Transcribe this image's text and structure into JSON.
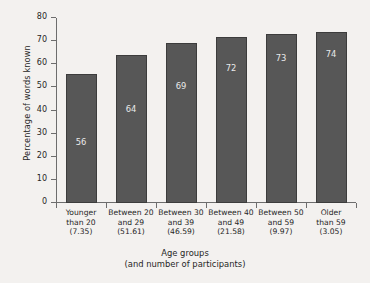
{
  "chart_data": {
    "type": "bar",
    "title": "",
    "xlabel": "Age groups",
    "xlabel_sub": "(and number of participants)",
    "ylabel": "Percentage of words known",
    "ylim": [
      0,
      80
    ],
    "yticks": [
      0,
      10,
      20,
      30,
      40,
      50,
      60,
      70,
      80
    ],
    "grid": false,
    "legend": null,
    "categories": [
      "Younger than 20 (7.35)",
      "Between 20 and 29 (51.61)",
      "Between 30 and 39 (46.59)",
      "Between 40 and 49 (21.58)",
      "Between 50 and 59 (9.97)",
      "Older than 59 (3.05)"
    ],
    "category_lines": [
      [
        "Younger",
        "than 20",
        "(7.35)"
      ],
      [
        "Between 20",
        "and 29",
        "(51.61)"
      ],
      [
        "Between 30",
        "and 39",
        "(46.59)"
      ],
      [
        "Between 40",
        "and 49",
        "(21.58)"
      ],
      [
        "Between 50",
        "and 59",
        "(9.97)"
      ],
      [
        "Older",
        "than 59",
        "(3.05)"
      ]
    ],
    "participants": [
      7.35,
      51.61,
      46.59,
      21.58,
      9.97,
      3.05
    ],
    "values": [
      56,
      64,
      69,
      72,
      73,
      74
    ],
    "value_labels": [
      "56",
      "64",
      "69",
      "72",
      "73",
      "74"
    ],
    "value_label_y": [
      24,
      38,
      48,
      56,
      60,
      62
    ],
    "colors": {
      "bar_fill": "#575757",
      "bar_stroke": "#3c3c3c",
      "value_label": "#e9e9e9",
      "axis": "#6d6d6d",
      "text": "#262626",
      "background": "#f3f1ef"
    }
  }
}
